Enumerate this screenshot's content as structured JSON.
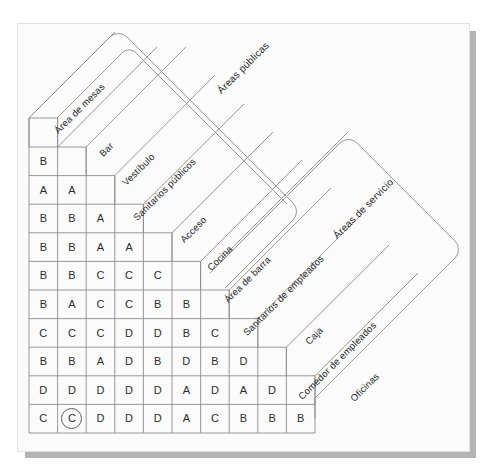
{
  "diagram": {
    "type": "relationship-matrix",
    "rating_codes": [
      "A",
      "B",
      "C",
      "D"
    ],
    "activities": [
      "Área de mesas",
      "Bar",
      "Vestíbulo",
      "Sanitarios públicos",
      "Acceso",
      "Cocina",
      "Área de barra",
      "Sanitarios de empleados",
      "Caja",
      "Comedor de empleados",
      "Oficinas"
    ],
    "groups": [
      {
        "label": "Áreas públicas"
      },
      {
        "label": "Áreas de servicio"
      }
    ],
    "matrix_rows": [
      [
        "B"
      ],
      [
        "A",
        "A"
      ],
      [
        "B",
        "B",
        "A"
      ],
      [
        "B",
        "B",
        "A",
        "A"
      ],
      [
        "B",
        "B",
        "C",
        "C",
        "C"
      ],
      [
        "B",
        "A",
        "C",
        "C",
        "B",
        "B"
      ],
      [
        "C",
        "C",
        "C",
        "D",
        "D",
        "B",
        "C"
      ],
      [
        "B",
        "B",
        "A",
        "D",
        "B",
        "D",
        "B",
        "D"
      ],
      [
        "D",
        "D",
        "D",
        "D",
        "D",
        "A",
        "D",
        "A",
        "D"
      ],
      [
        "C",
        "C",
        "D",
        "D",
        "D",
        "A",
        "C",
        "B",
        "B",
        "B"
      ]
    ],
    "highlighted_cell": {
      "row": 9,
      "col": 1,
      "value": "C"
    },
    "colors": {
      "paper": "#fbfbfb",
      "shadow": "#b4b4b4",
      "line": "#8c8c8c",
      "text": "#1f1f1f"
    }
  }
}
